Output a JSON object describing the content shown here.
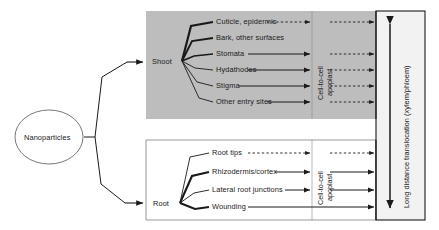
{
  "diagram": {
    "source_node": {
      "label": "Nanoparticles"
    },
    "colors": {
      "shoot_panel_fill": "#bdbdbd",
      "root_panel_fill": "#ffffff",
      "translocation_fill": "#f2f2f2",
      "line": "#1a1a1a",
      "text": "#1a1a1a"
    },
    "panels": [
      {
        "id": "shoot",
        "organ_label": "Shoot",
        "entry_points": [
          {
            "label": "Cuticle, epidermis",
            "apoplast_arrow": "dashed",
            "translocation_arrow": "dashed"
          },
          {
            "label": "Bark, other surfaces",
            "apoplast_arrow": "none",
            "translocation_arrow": "none"
          },
          {
            "label": "Stomata",
            "apoplast_arrow": "solid",
            "translocation_arrow": "dashed"
          },
          {
            "label": "Hydathodes",
            "apoplast_arrow": "solid",
            "translocation_arrow": "dashed"
          },
          {
            "label": "Stigma",
            "apoplast_arrow": "solid",
            "translocation_arrow": "dashed"
          },
          {
            "label": "Other entry sites",
            "apoplast_arrow": "solid",
            "translocation_arrow": "dashed"
          }
        ],
        "barrier_label_line1": "Cell-to-cell",
        "barrier_label_line2": "apoplast"
      },
      {
        "id": "root",
        "organ_label": "Root",
        "entry_points": [
          {
            "label": "Root tips",
            "apoplast_arrow": "dashed",
            "translocation_arrow": "dashed"
          },
          {
            "label": "Rhizodermis/cortex",
            "apoplast_arrow": "solid",
            "translocation_arrow": "dashed"
          },
          {
            "label": "Lateral root junctions",
            "apoplast_arrow": "solid",
            "translocation_arrow": "dashed"
          },
          {
            "label": "Wounding",
            "apoplast_arrow": "solid",
            "translocation_arrow": "solid"
          }
        ],
        "barrier_label_line1": "Cell-to-cell",
        "barrier_label_line2": "apoplast"
      }
    ],
    "translocation": {
      "label": "Long distance translocation (xylem/phloem)",
      "arrow": "double-headed-vertical"
    }
  }
}
